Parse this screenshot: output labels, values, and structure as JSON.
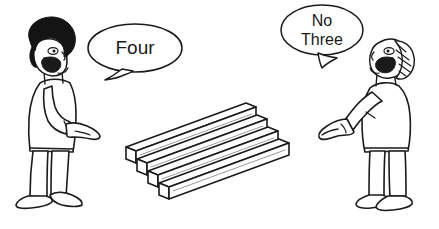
{
  "illustration": {
    "title": "Two people counting stacked wooden planks",
    "type": "line-art-cartoon",
    "background_color": "#ffffff",
    "ink_color": "#1a1a1a",
    "width": 439,
    "height": 229
  },
  "speech_bubbles": [
    {
      "id": "left-bubble",
      "speaker": "left-person",
      "lines": [
        "Four"
      ],
      "line1": "Four",
      "shape": "ellipse",
      "tail_direction": "down-left",
      "font_size": 19
    },
    {
      "id": "right-bubble",
      "speaker": "right-person",
      "lines": [
        "No",
        "Three"
      ],
      "line1": "No",
      "line2": "Three",
      "shape": "ellipse",
      "tail_direction": "down-right",
      "font_size": 16
    }
  ],
  "characters": [
    {
      "id": "left-person",
      "position": "left",
      "facing": "right",
      "hair": "solid black afro",
      "hair_color": "#141414",
      "mouth": "open speaking",
      "arm": "extended pointing right"
    },
    {
      "id": "right-person",
      "position": "right",
      "facing": "left",
      "hair": "hatched striped",
      "hair_color": "#ffffff",
      "mouth": "open speaking",
      "arm": "extended pointing left with index finger"
    }
  ],
  "planks": {
    "count": 4,
    "description": "four square-section wooden beams drawn in isometric projection, running lower-left to upper-right, each offset down and to the right",
    "orientation": "diagonal isometric",
    "fill_color": "#ffffff",
    "outline_color": "#1a1a1a"
  }
}
